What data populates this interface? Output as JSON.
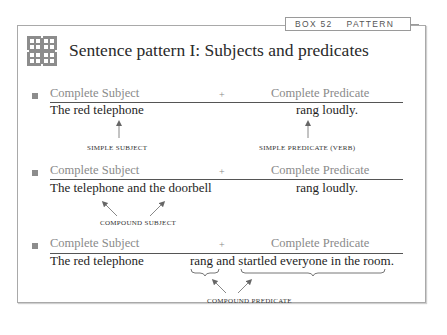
{
  "box_tab": {
    "number": "BOX 52",
    "category": "PATTERN"
  },
  "logo": {
    "icon": "interlaced-knot-icon",
    "color": "#8c8c8c"
  },
  "title": "Sentence pattern I: Subjects and predicates",
  "header_labels": {
    "subject": "Complete Subject",
    "plus": "+",
    "predicate": "Complete Predicate"
  },
  "examples": [
    {
      "subject_label": "Complete Subject",
      "plus": "+",
      "predicate_label": "Complete Predicate",
      "subject": "The red telephone",
      "predicate": "rang loudly.",
      "subject_caption": "SIMPLE SUBJECT",
      "predicate_caption": "SIMPLE PREDICATE (VERB)"
    },
    {
      "subject_label": "Complete Subject",
      "plus": "+",
      "predicate_label": "Complete Predicate",
      "subject": "The telephone and the doorbell",
      "predicate": "rang loudly.",
      "subject_caption": "COMPOUND SUBJECT"
    },
    {
      "subject_label": "Complete Subject",
      "plus": "+",
      "predicate_label": "Complete Predicate",
      "subject": "The red telephone",
      "predicate": "rang and startled everyone in the room.",
      "predicate_caption": "COMPOUND PREDICATE"
    }
  ],
  "colors": {
    "frame": "#a9a9a9",
    "label_gray": "#8a8a8a",
    "text": "#1e1e1e",
    "rule": "#555555"
  }
}
